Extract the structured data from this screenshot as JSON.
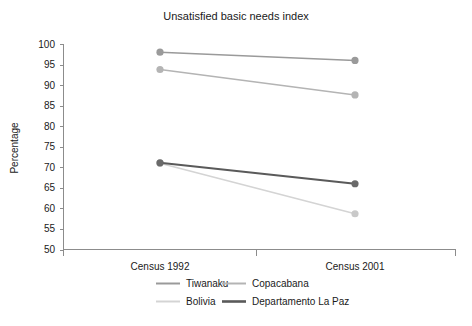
{
  "chart_data": {
    "type": "line",
    "title": "Unsatisfied basic needs index",
    "xlabel": "",
    "ylabel": "Percentage",
    "categories": [
      "Census 1992",
      "Census 2001"
    ],
    "ylim": [
      50,
      100
    ],
    "yticks": [
      50,
      55,
      60,
      65,
      70,
      75,
      80,
      85,
      90,
      95,
      100
    ],
    "ytick_labels": [
      "50",
      "55",
      "60",
      "65",
      "70",
      "75",
      "80",
      "85",
      "90",
      "95",
      "100"
    ],
    "grid": false,
    "legend_position": "bottom",
    "series": [
      {
        "name": "Tiwanaku",
        "values": [
          98.0,
          96.0
        ],
        "color": "#9a9a9a",
        "marker_color": "#9a9a9a",
        "line_width": 1.6
      },
      {
        "name": "Copacabana",
        "values": [
          93.8,
          87.6
        ],
        "color": "#b4b4b4",
        "marker_color": "#b4b4b4",
        "line_width": 1.6
      },
      {
        "name": "Bolivia",
        "values": [
          71.0,
          58.7
        ],
        "color": "#d4d4d4",
        "marker_color": "#c9c9c9",
        "line_width": 1.6
      },
      {
        "name": "Departamento La Paz",
        "values": [
          71.1,
          66.0
        ],
        "color": "#5a5a5a",
        "marker_color": "#6a6a6a",
        "line_width": 2.0
      }
    ],
    "legend_entries": [
      {
        "label": "Tiwanaku",
        "color": "#9a9a9a",
        "line_width": 2.0
      },
      {
        "label": "Copacabana",
        "color": "#b4b4b4",
        "line_width": 2.0
      },
      {
        "label": "Bolivia",
        "color": "#d4d4d4",
        "line_width": 2.0
      },
      {
        "label": "Departamento La Paz",
        "color": "#5a5a5a",
        "line_width": 2.6
      }
    ]
  },
  "colors": {
    "background": "#ffffff",
    "axis": "#8c8c8c",
    "text": "#1a1a1a"
  }
}
